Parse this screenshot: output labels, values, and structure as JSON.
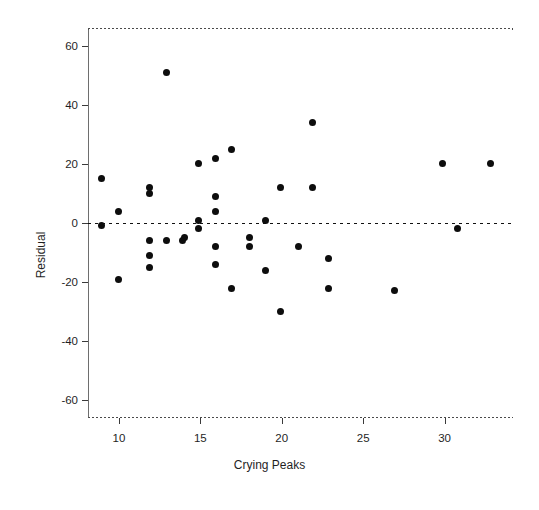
{
  "figure": {
    "background": "#ffffff",
    "point_color": "#0d0d0d",
    "axis_color": "#3a3a3a"
  },
  "chart_data": {
    "type": "scatter",
    "title": "",
    "xlabel": "Crying Peaks",
    "ylabel": "Residual",
    "xlim": [
      8.1,
      34.2
    ],
    "ylim": [
      -66,
      66
    ],
    "xticks": [
      10,
      15,
      20,
      25,
      30
    ],
    "yticks": [
      60,
      40,
      20,
      0,
      -20,
      -40,
      -60
    ],
    "xtick_labels": [
      "10",
      "15",
      "20",
      "25",
      "30"
    ],
    "ytick_labels": [
      "60",
      "40",
      "20",
      "0",
      "-20",
      "-40",
      "-60"
    ],
    "grid": false,
    "legend": null,
    "annotations": [
      {
        "kind": "reference-line",
        "orientation": "horizontal",
        "value": 0,
        "style": "dashed",
        "label": "zero residual line"
      }
    ],
    "series": [
      {
        "name": "Residuals",
        "marker": "filled-circle",
        "color": "#0d0d0d",
        "points": [
          [
            8.9,
            15
          ],
          [
            8.9,
            -1
          ],
          [
            10.0,
            4
          ],
          [
            10.0,
            -19
          ],
          [
            11.9,
            12
          ],
          [
            11.9,
            10
          ],
          [
            11.9,
            -6
          ],
          [
            11.9,
            -11
          ],
          [
            11.9,
            -15
          ],
          [
            12.9,
            -6
          ],
          [
            12.9,
            51
          ],
          [
            13.9,
            -6
          ],
          [
            14.9,
            20
          ],
          [
            14.9,
            1
          ],
          [
            14.9,
            -2
          ],
          [
            14.0,
            -5
          ],
          [
            15.9,
            22
          ],
          [
            15.9,
            9
          ],
          [
            15.9,
            4
          ],
          [
            15.9,
            -8
          ],
          [
            15.9,
            -14
          ],
          [
            16.9,
            25
          ],
          [
            16.9,
            -22
          ],
          [
            18.0,
            -5
          ],
          [
            18.0,
            -8
          ],
          [
            19.0,
            1
          ],
          [
            19.0,
            -16
          ],
          [
            19.9,
            12
          ],
          [
            19.9,
            -30
          ],
          [
            21.0,
            -8
          ],
          [
            21.9,
            34
          ],
          [
            21.9,
            12
          ],
          [
            22.9,
            -12
          ],
          [
            22.9,
            -22
          ],
          [
            26.9,
            -23
          ],
          [
            29.9,
            20
          ],
          [
            30.8,
            -2
          ],
          [
            32.8,
            20
          ]
        ]
      }
    ]
  }
}
